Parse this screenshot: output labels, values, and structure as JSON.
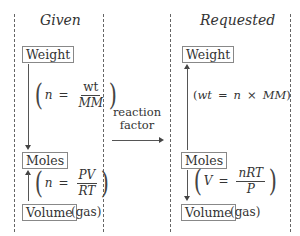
{
  "columns": {
    "given": {
      "heading": "Given",
      "boxes": {
        "weight": "Weight",
        "moles": "Moles",
        "volume": "Volume",
        "volume_note": "(gas)"
      },
      "formulas": {
        "weight_to_moles": {
          "lhs": "n",
          "eq": "=",
          "num": "wt",
          "den": "MM"
        },
        "volume_to_moles": {
          "lhs": "n",
          "eq": "=",
          "num": "PV",
          "den": "RT"
        }
      }
    },
    "requested": {
      "heading": "Requested",
      "boxes": {
        "weight": "Weight",
        "moles": "Moles",
        "volume": "Volume",
        "volume_note": "(gas)"
      },
      "formulas": {
        "moles_to_weight": {
          "text_lhs": "wt",
          "eq": "=",
          "a": "n",
          "times": "×",
          "b": "MM"
        },
        "moles_to_volume": {
          "lhs": "V",
          "eq": "=",
          "num": "nRT",
          "den": "P"
        }
      }
    }
  },
  "bridge": {
    "line1": "reaction",
    "line2": "factor"
  },
  "colors": {
    "text": "#333333",
    "lines": "#555555",
    "background": "#ffffff"
  }
}
